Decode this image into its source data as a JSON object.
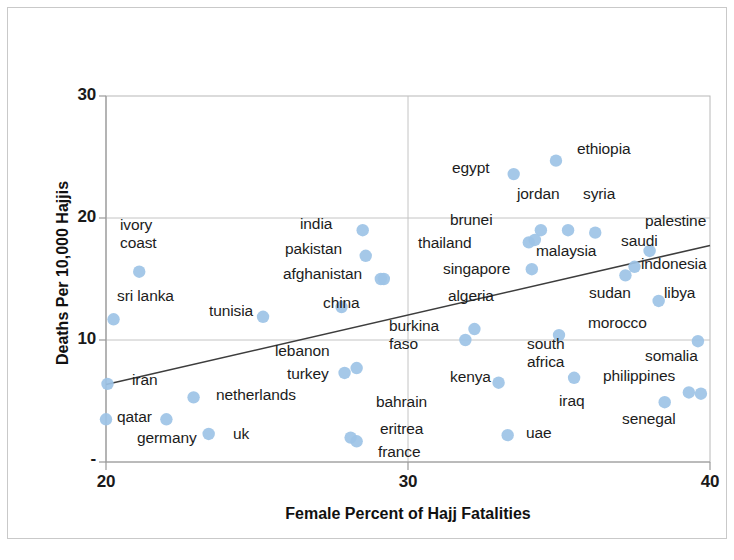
{
  "chart_data": {
    "type": "scatter",
    "title": "",
    "xlabel": "Female Percent of Hajj Fatalities",
    "ylabel": "Deaths Per 10,000 Hajjis",
    "xlim": [
      20,
      40
    ],
    "ylim": [
      0,
      30
    ],
    "x_ticks": [
      "20",
      "30",
      "40"
    ],
    "x_tick_values": [
      20,
      30,
      40
    ],
    "y_ticks": [
      "30",
      "20",
      "10",
      "-"
    ],
    "y_tick_values": [
      30,
      20,
      10,
      0
    ],
    "grid": true,
    "legend": "none",
    "marker_color": "#9dc3e6",
    "trendline": {
      "present": true,
      "color": "#3d3d3d",
      "x_start": 20.0,
      "y_start": 6.35,
      "x_end": 40.0,
      "y_end": 17.75
    },
    "points": [
      {
        "label": "qatar",
        "x": 20.0,
        "y": 3.5
      },
      {
        "label": "iran",
        "x": 20.05,
        "y": 6.4
      },
      {
        "label": "sri lanka",
        "x": 20.25,
        "y": 11.7
      },
      {
        "label": "ivory coast",
        "x": 21.1,
        "y": 15.6
      },
      {
        "label": "germany",
        "x": 22.0,
        "y": 3.5
      },
      {
        "label": "netherlands",
        "x": 22.9,
        "y": 5.3
      },
      {
        "label": "uk",
        "x": 23.4,
        "y": 2.3
      },
      {
        "label": "tunisia",
        "x": 25.2,
        "y": 11.9
      },
      {
        "label": "china",
        "x": 27.8,
        "y": 12.7
      },
      {
        "label": "lebanon",
        "x": 27.9,
        "y": 7.3
      },
      {
        "label": "turkey",
        "x": 28.3,
        "y": 7.7
      },
      {
        "label": "eritrea",
        "x": 28.1,
        "y": 2.0
      },
      {
        "label": "france",
        "x": 28.3,
        "y": 1.7
      },
      {
        "label": "india",
        "x": 28.5,
        "y": 19.0
      },
      {
        "label": "pakistan",
        "x": 28.6,
        "y": 16.9
      },
      {
        "label": "bahrain",
        "x": 29.2,
        "y": 15.0
      },
      {
        "label": "afghanistan",
        "x": 29.1,
        "y": 15.0
      },
      {
        "label": "burkina faso",
        "x": 31.9,
        "y": 10.0
      },
      {
        "label": "algeria",
        "x": 32.2,
        "y": 10.9
      },
      {
        "label": "kenya",
        "x": 33.0,
        "y": 6.5
      },
      {
        "label": "uae",
        "x": 33.3,
        "y": 2.2
      },
      {
        "label": "south africa",
        "x": 33.5,
        "y": 23.6
      },
      {
        "label": "thailand",
        "x": 34.0,
        "y": 18.0
      },
      {
        "label": "singapore",
        "x": 34.1,
        "y": 15.8
      },
      {
        "label": "brunei",
        "x": 34.2,
        "y": 18.2
      },
      {
        "label": "jordan",
        "x": 34.4,
        "y": 19.0
      },
      {
        "label": "ethiopia",
        "x": 34.9,
        "y": 24.7
      },
      {
        "label": "egypt",
        "x": 35.0,
        "y": 10.4
      },
      {
        "label": "malaysia",
        "x": 35.3,
        "y": 19.0
      },
      {
        "label": "morocco",
        "x": 35.5,
        "y": 6.9
      },
      {
        "label": "syria",
        "x": 36.2,
        "y": 18.8
      },
      {
        "label": "saudi",
        "x": 37.2,
        "y": 15.3
      },
      {
        "label": "sudan",
        "x": 37.5,
        "y": 16.0
      },
      {
        "label": "palestine",
        "x": 38.0,
        "y": 17.3
      },
      {
        "label": "indonesia",
        "x": 38.3,
        "y": 13.2
      },
      {
        "label": "libya",
        "x": 38.5,
        "y": 4.9
      },
      {
        "label": "philippines",
        "x": 39.3,
        "y": 5.7
      },
      {
        "label": "somalia",
        "x": 39.6,
        "y": 9.9
      },
      {
        "label": "senegal",
        "x": 39.7,
        "y": 5.6
      }
    ],
    "label_texts": [
      "ivory",
      "coast",
      "sri lanka",
      "iran",
      "qatar",
      "germany",
      "uk",
      "netherlands",
      "tunisia",
      "india",
      "pakistan",
      "afghanistan",
      "china",
      "lebanon",
      "turkey",
      "bahrain",
      "eritrea",
      "france",
      "burkina",
      "faso",
      "egypt",
      "ethiopia",
      "jordan",
      "syria",
      "brunei",
      "thailand",
      "singapore",
      "algeria",
      "malaysia",
      "saudi",
      "palestine",
      "indonesia",
      "sudan",
      "libya",
      "morocco",
      "south",
      "africa",
      "kenya",
      "iraq",
      "uae",
      "somalia",
      "philippines",
      "senegal"
    ]
  },
  "labels": {
    "ivory_coast": "ivory\ncoast",
    "sri_lanka": "sri lanka",
    "iran": "iran",
    "qatar": "qatar",
    "germany": "germany",
    "uk": "uk",
    "netherlands": "netherlands",
    "tunisia": "tunisia",
    "india": "india",
    "pakistan": "pakistan",
    "afghanistan": "afghanistan",
    "china": "china",
    "lebanon": "lebanon",
    "turkey": "turkey",
    "bahrain": "bahrain",
    "eritrea": "eritrea",
    "france": "france",
    "burkina_faso": "burkina\nfaso",
    "egypt": "egypt",
    "ethiopia": "ethiopia",
    "jordan": "jordan",
    "syria": "syria",
    "brunei": "brunei",
    "thailand": "thailand",
    "singapore": "singapore",
    "algeria": "algeria",
    "malaysia": "malaysia",
    "saudi": "saudi",
    "palestine": "palestine",
    "indonesia": "indonesia",
    "sudan": "sudan",
    "libya": "libya",
    "morocco": "morocco",
    "south_africa": "south\nafrica",
    "kenya": "kenya",
    "iraq": "iraq",
    "uae": "uae",
    "somalia": "somalia",
    "philippines": "philippines",
    "senegal": "senegal"
  },
  "axes": {
    "y_title": "Deaths Per 10,000 Hajjis",
    "x_title": "Female Percent of Hajj Fatalities",
    "y_tick_30": "30",
    "y_tick_20": "20",
    "y_tick_10": "10",
    "y_tick_0": "-",
    "x_tick_20": "20",
    "x_tick_30": "30",
    "x_tick_40": "40"
  }
}
